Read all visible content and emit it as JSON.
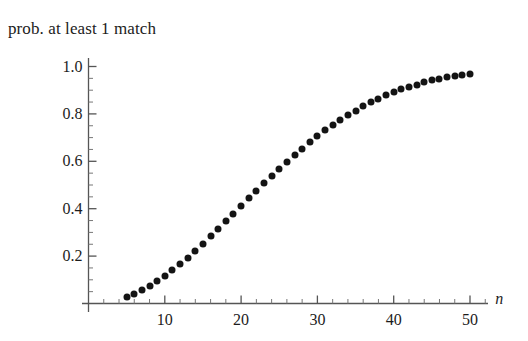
{
  "chart_data": {
    "type": "scatter",
    "title": "prob. at least 1 match",
    "xlabel": "n",
    "ylabel": "",
    "xlim": [
      0,
      52
    ],
    "ylim": [
      0,
      1.05
    ],
    "grid": false,
    "legend": null,
    "marker": {
      "shape": "circle",
      "color": "#141414",
      "size_px": 7
    },
    "x_ticks": [
      10,
      20,
      30,
      40,
      50
    ],
    "x_tick_labels": [
      "10",
      "20",
      "30",
      "40",
      "50"
    ],
    "x_minor_tick_step": 2,
    "y_ticks": [
      0.2,
      0.4,
      0.6,
      0.8,
      1.0
    ],
    "y_tick_labels": [
      "0.2",
      "0.4",
      "0.6",
      "0.8",
      "1.0"
    ],
    "y_minor_tick_step": 0.05,
    "x": [
      5,
      6,
      7,
      8,
      9,
      10,
      11,
      12,
      13,
      14,
      15,
      16,
      17,
      18,
      19,
      20,
      21,
      22,
      23,
      24,
      25,
      26,
      27,
      28,
      29,
      30,
      31,
      32,
      33,
      34,
      35,
      36,
      37,
      38,
      39,
      40,
      41,
      42,
      43,
      44,
      45,
      46,
      47,
      48,
      49,
      50
    ],
    "values": [
      0.027,
      0.04,
      0.056,
      0.074,
      0.095,
      0.117,
      0.141,
      0.167,
      0.194,
      0.223,
      0.253,
      0.284,
      0.315,
      0.347,
      0.379,
      0.411,
      0.444,
      0.476,
      0.507,
      0.538,
      0.569,
      0.598,
      0.627,
      0.654,
      0.681,
      0.706,
      0.73,
      0.753,
      0.775,
      0.795,
      0.814,
      0.832,
      0.849,
      0.864,
      0.878,
      0.891,
      0.903,
      0.914,
      0.924,
      0.933,
      0.941,
      0.948,
      0.955,
      0.961,
      0.966,
      0.97
    ],
    "series_name": "prob. at least 1 match"
  },
  "axes": {
    "x_axis_label": "n",
    "y_axis_label": ""
  },
  "colors": {
    "background": "#ffffff",
    "axis": "#555555",
    "marker": "#141414",
    "text": "#1c1c1c"
  }
}
